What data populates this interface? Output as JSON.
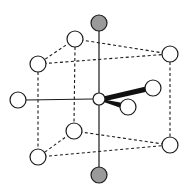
{
  "diagram": {
    "colors": {
      "background": "#ffffff",
      "stroke": "#1a1a1a",
      "open_fill": "#ffffff",
      "axial_fill": "#9a9a9a"
    },
    "center_atom": {
      "x": 99,
      "y": 99,
      "r": 6
    },
    "axial_atoms": [
      {
        "id": "top",
        "x": 99,
        "y": 23,
        "r": 8
      },
      {
        "id": "bottom",
        "x": 99,
        "y": 175,
        "r": 8
      }
    ],
    "cage_atoms": [
      {
        "id": "top-back",
        "x": 75,
        "y": 39,
        "r": 8
      },
      {
        "id": "top-front-left",
        "x": 38,
        "y": 64,
        "r": 8
      },
      {
        "id": "top-right",
        "x": 170,
        "y": 54,
        "r": 8
      },
      {
        "id": "bottom-back",
        "x": 74,
        "y": 131,
        "r": 8
      },
      {
        "id": "bottom-front-left",
        "x": 38,
        "y": 157,
        "r": 8
      },
      {
        "id": "bottom-right",
        "x": 170,
        "y": 145,
        "r": 8
      }
    ],
    "side_atoms": [
      {
        "id": "left",
        "x": 18,
        "y": 100,
        "r": 8
      }
    ],
    "ligand_atoms": [
      {
        "id": "ligand-upper",
        "x": 153,
        "y": 88,
        "r": 8
      },
      {
        "id": "ligand-lower",
        "x": 128,
        "y": 107,
        "r": 8
      }
    ]
  }
}
